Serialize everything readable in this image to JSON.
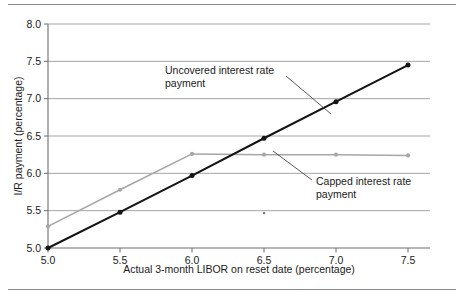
{
  "figure": {
    "rules": [
      "top-rule",
      "bottom-rule"
    ]
  },
  "chart_data": {
    "type": "line",
    "title": "",
    "xlabel": "Actual 3-month LIBOR on reset date (percentage)",
    "ylabel": "I/R payment (percentage)",
    "xlim": [
      5.0,
      7.5
    ],
    "ylim": [
      5.0,
      8.0
    ],
    "xticks": [
      "5.0",
      "5.5",
      "6.0",
      "6.5",
      "7.0",
      "7.5"
    ],
    "yticks": [
      "5.0",
      "5.5",
      "6.0",
      "6.5",
      "7.0",
      "7.5",
      "8.0"
    ],
    "xtick_values": [
      5.0,
      5.5,
      6.0,
      6.5,
      7.0,
      7.5
    ],
    "ytick_values": [
      5.0,
      5.5,
      6.0,
      6.5,
      7.0,
      7.5,
      8.0
    ],
    "grid": "horizontal",
    "legend": "none",
    "x": [
      5.0,
      5.5,
      6.0,
      6.5,
      7.0,
      7.5
    ],
    "series": [
      {
        "name": "Uncovered interest rate payment",
        "color": "#141414",
        "marker": "circle",
        "values": [
          5.0,
          5.48,
          5.97,
          6.47,
          6.96,
          7.45
        ]
      },
      {
        "name": "Capped interest rate payment",
        "color": "#a6a6a6",
        "marker": "circle",
        "values": [
          5.29,
          5.78,
          6.26,
          6.25,
          6.25,
          6.24
        ]
      }
    ],
    "annotations": [
      {
        "id": "uncovered-annotation",
        "line1": "Uncovered interest rate",
        "line2": "payment",
        "text_x": 165,
        "text_y": 74,
        "leader_from_x": 286,
        "leader_from_y": 76,
        "leader_to_x": 331,
        "leader_to_y": 114
      },
      {
        "id": "capped-annotation",
        "line1": "Capped interest rate",
        "line2": "payment",
        "text_x": 316,
        "text_y": 185,
        "leader_from_x": 312,
        "leader_from_y": 180,
        "leader_to_x": 273,
        "leader_to_y": 151
      }
    ]
  }
}
